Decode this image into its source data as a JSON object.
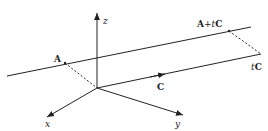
{
  "diagram": {
    "labels": {
      "z": "z",
      "x": "x",
      "y": "y",
      "A": "A",
      "A_plus": "A",
      "plus": "+",
      "t1": "t",
      "C1": "C",
      "t2": "t",
      "C2": "C",
      "C": "C"
    }
  }
}
